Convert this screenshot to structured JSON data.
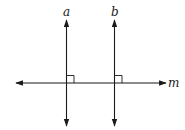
{
  "diagram": {
    "title": "",
    "lines": [
      {
        "id": "a",
        "label": "a",
        "orientation": "vertical",
        "x": 66.5,
        "y1": 20,
        "y2": 126
      },
      {
        "id": "b",
        "label": "b",
        "orientation": "vertical",
        "x": 114.5,
        "y1": 20,
        "y2": 126
      },
      {
        "id": "m",
        "label": "m",
        "orientation": "horizontal",
        "y": 83,
        "x1": 16,
        "x2": 166
      }
    ],
    "right_angles": [
      {
        "at": "a-m intersection",
        "x": 66.5,
        "y": 83,
        "size": 7
      },
      {
        "at": "b-m intersection",
        "x": 114.5,
        "y": 83,
        "size": 7
      }
    ],
    "colors": {
      "stroke": "#1a1a1a",
      "background": "#ffffff"
    }
  }
}
